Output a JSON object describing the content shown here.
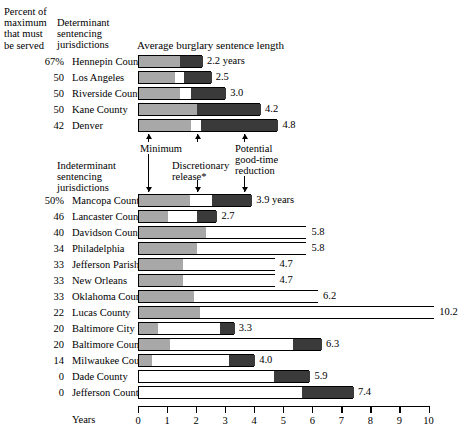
{
  "header": {
    "percent_header": "Percent of\nmaximum\nthat must\nbe served",
    "determinate_header": "Determinant\nsentencing\njurisdictions",
    "indeterminate_header": "Indeterminant\nsentencing\njurisdictions",
    "chart_title": "Average burglary sentence length"
  },
  "annotations": {
    "minimum": "Minimum",
    "discretionary": "Discretionary\nrelease*",
    "goodtime": "Potential\ngood-time\nreduction"
  },
  "axis": {
    "label": "Years",
    "ticks": [
      "0",
      "1",
      "2",
      "3",
      "4",
      "5",
      "6",
      "7",
      "8",
      "9",
      "10"
    ]
  },
  "chart_data": {
    "type": "bar",
    "title": "Average burglary sentence length",
    "xlabel": "Years",
    "ylabel": "",
    "xlim": [
      0,
      10
    ],
    "grid": false,
    "legend_position": "inline-annotations",
    "stacked": true,
    "segments": [
      "Minimum",
      "Discretionary release*",
      "Potential good-time reduction"
    ],
    "segment_colors": [
      "#a8a8a8",
      "#ffffff",
      "#3a3a3a"
    ],
    "groups": [
      {
        "name": "Determinant sentencing jurisdictions",
        "rows": [
          {
            "pct": "67%",
            "juris": "Hennepin County",
            "total": 2.2,
            "total_label": "2.2 years",
            "min": 1.4,
            "disc": 0.0,
            "good": 0.8
          },
          {
            "pct": "50",
            "juris": "Los Angeles",
            "total": 2.5,
            "total_label": "2.5",
            "min": 1.25,
            "disc": 0.3,
            "good": 0.95
          },
          {
            "pct": "50",
            "juris": "Riverside County",
            "total": 3.0,
            "total_label": "3.0",
            "min": 1.4,
            "disc": 0.4,
            "good": 1.2
          },
          {
            "pct": "50",
            "juris": "Kane County",
            "total": 4.2,
            "total_label": "4.2",
            "min": 2.0,
            "disc": 0.0,
            "good": 2.2
          },
          {
            "pct": "42",
            "juris": "Denver",
            "total": 4.8,
            "total_label": "4.8",
            "min": 1.8,
            "disc": 0.35,
            "good": 2.65
          }
        ]
      },
      {
        "name": "Indeterminant sentencing jurisdictions",
        "rows": [
          {
            "pct": "50%",
            "juris": "Mancopa County",
            "total": 3.9,
            "total_label": "3.9 years",
            "min": 1.75,
            "disc": 0.75,
            "good": 1.4
          },
          {
            "pct": "46",
            "juris": "Lancaster County",
            "total": 2.7,
            "total_label": "2.7",
            "min": 1.0,
            "disc": 1.0,
            "good": 0.7
          },
          {
            "pct": "40",
            "juris": "Davidson County",
            "total": 5.8,
            "total_label": "5.8",
            "min": 2.3,
            "disc": 3.5,
            "good": 0.0
          },
          {
            "pct": "34",
            "juris": "Philadelphia",
            "total": 5.8,
            "total_label": "5.8",
            "min": 2.0,
            "disc": 3.8,
            "good": 0.0
          },
          {
            "pct": "33",
            "juris": "Jefferson Parish",
            "total": 4.7,
            "total_label": "4.7",
            "min": 1.5,
            "disc": 3.2,
            "good": 0.0
          },
          {
            "pct": "33",
            "juris": "New Orleans",
            "total": 4.7,
            "total_label": "4.7",
            "min": 1.5,
            "disc": 3.2,
            "good": 0.0
          },
          {
            "pct": "33",
            "juris": "Oklahoma County",
            "total": 6.2,
            "total_label": "6.2",
            "min": 1.9,
            "disc": 4.3,
            "good": 0.0
          },
          {
            "pct": "22",
            "juris": "Lucas County",
            "total": 10.2,
            "total_label": "10.2",
            "min": 2.1,
            "disc": 8.1,
            "good": 0.0
          },
          {
            "pct": "20",
            "juris": "Baltimore City",
            "total": 3.3,
            "total_label": "3.3",
            "min": 0.65,
            "disc": 2.15,
            "good": 0.5
          },
          {
            "pct": "20",
            "juris": "Baltimore County",
            "total": 6.3,
            "total_label": "6.3",
            "min": 1.05,
            "disc": 4.25,
            "good": 1.0
          },
          {
            "pct": "14",
            "juris": "Milwaukee County",
            "total": 4.0,
            "total_label": "4.0",
            "min": 0.45,
            "disc": 2.65,
            "good": 0.9
          },
          {
            "pct": "0",
            "juris": "Dade County",
            "total": 5.9,
            "total_label": "5.9",
            "min": 0.0,
            "disc": 4.65,
            "good": 1.25
          },
          {
            "pct": "0",
            "juris": "Jefferson County",
            "total": 7.4,
            "total_label": "7.4",
            "min": 0.0,
            "disc": 5.6,
            "good": 1.8
          }
        ]
      }
    ]
  }
}
